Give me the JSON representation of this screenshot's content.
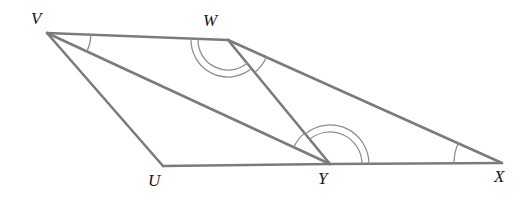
{
  "figure": {
    "line_color": "#7b7b7b",
    "arc_color": "#8d8d8d",
    "label_color": "#171717",
    "background_color": "#ffffff",
    "width": 532,
    "height": 203
  },
  "vertices": [
    {
      "id": "V",
      "label": "V",
      "x": 47,
      "y": 33,
      "label_x": 31,
      "label_y": 10
    },
    {
      "id": "W",
      "label": "W",
      "x": 228,
      "y": 40,
      "label_x": 203,
      "label_y": 12
    },
    {
      "id": "U",
      "label": "U",
      "x": 163,
      "y": 166,
      "label_x": 148,
      "label_y": 172
    },
    {
      "id": "Y",
      "label": "Y",
      "x": 330,
      "y": 164,
      "label_x": 318,
      "label_y": 170
    },
    {
      "id": "X",
      "label": "X",
      "x": 502,
      "y": 163,
      "label_x": 494,
      "label_y": 168
    }
  ],
  "segments": [
    {
      "id": "VW",
      "from": "V",
      "to": "W",
      "name": "segment-vw"
    },
    {
      "id": "VU",
      "from": "V",
      "to": "U",
      "name": "segment-vu"
    },
    {
      "id": "VY",
      "from": "V",
      "to": "Y",
      "name": "segment-vy"
    },
    {
      "id": "WY",
      "from": "W",
      "to": "Y",
      "name": "segment-wy"
    },
    {
      "id": "WX",
      "from": "W",
      "to": "X",
      "name": "segment-wx"
    },
    {
      "id": "UY",
      "from": "U",
      "to": "Y",
      "name": "segment-uy"
    },
    {
      "id": "YX",
      "from": "Y",
      "to": "X",
      "name": "segment-yx"
    }
  ],
  "angle_marks": [
    {
      "id": "angle-V",
      "vertex": "V",
      "from": "W",
      "to": "Y",
      "arcs": 1,
      "radius": 44,
      "name": "angle-mark-v"
    },
    {
      "id": "angle-VWY",
      "vertex": "W",
      "from": "V",
      "to": "Y",
      "arcs": 2,
      "radius": 30,
      "name": "angle-mark-vwy"
    },
    {
      "id": "angle-YWX",
      "vertex": "W",
      "from": "Y",
      "to": "X",
      "arcs": 1,
      "radius": 42,
      "name": "angle-mark-ywx"
    },
    {
      "id": "angle-WYV",
      "vertex": "Y",
      "from": "V",
      "to": "W",
      "arcs": 1,
      "radius": 40,
      "name": "angle-mark-wyv"
    },
    {
      "id": "angle-WYX",
      "vertex": "Y",
      "from": "W",
      "to": "X",
      "arcs": 2,
      "radius": 32,
      "name": "angle-mark-wyx"
    },
    {
      "id": "angle-X",
      "vertex": "X",
      "from": "W",
      "to": "Y",
      "arcs": 1,
      "radius": 48,
      "name": "angle-mark-x"
    }
  ]
}
